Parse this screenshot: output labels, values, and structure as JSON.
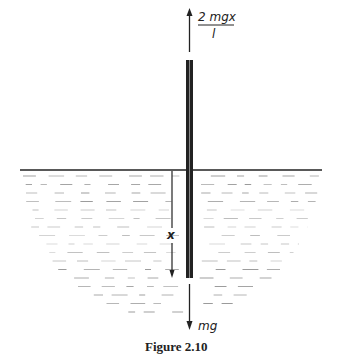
{
  "figure": {
    "caption": "Figure 2.10",
    "colors": {
      "ink": "#222222",
      "water": "#9a9a9a",
      "background": "#ffffff"
    }
  },
  "labels": {
    "force_up_numerator": "2 mgx",
    "force_up_denominator": "l",
    "depth": "x",
    "weight": "mg"
  },
  "elements": {
    "rod": "vertical rod partially submerged",
    "surface": "liquid surface line",
    "liquid": "hatched liquid body"
  }
}
